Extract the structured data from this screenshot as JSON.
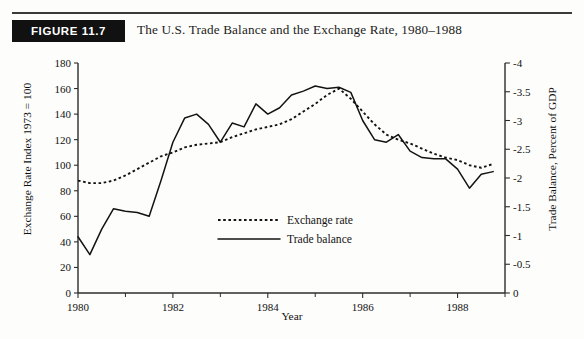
{
  "header": {
    "badge_label": "FIGURE 11.7",
    "title": "The U.S. Trade Balance and the Exchange Rate, 1980–1988"
  },
  "chart_data": {
    "type": "line",
    "title": "The U.S. Trade Balance and the Exchange Rate, 1980–1988",
    "xlabel": "Year",
    "ylabel": "Exchange Rate Index 1973 = 100",
    "ylabel_right": "Trade Balance,  Percent of GDP",
    "xlim": [
      1980,
      1989
    ],
    "ylim": [
      0,
      180
    ],
    "ylim_right": [
      0,
      -4
    ],
    "grid": false,
    "legend_position": "center",
    "xticks": [
      1980,
      1982,
      1984,
      1986,
      1988
    ],
    "xticklabels": [
      "1980",
      "1982",
      "1984",
      "1986",
      "1988"
    ],
    "xticks_minor": [
      1981,
      1983,
      1985,
      1987,
      1989
    ],
    "yticks": [
      0,
      20,
      40,
      60,
      80,
      100,
      120,
      140,
      160,
      180
    ],
    "yticklabels": [
      "0",
      "20",
      "40",
      "60",
      "80",
      "100",
      "120",
      "140",
      "160",
      "180"
    ],
    "yticks_right": [
      0,
      -0.5,
      -1,
      -1.5,
      -2,
      -2.5,
      -3,
      -3.5,
      -4
    ],
    "yticklabels_right": [
      "0",
      "-0.5",
      "-1",
      "-1.5",
      "-2",
      "-2.5",
      "-3",
      "-3.5",
      "-4"
    ],
    "series": [
      {
        "name": "Exchange rate",
        "style": "dotted",
        "axis": "left",
        "x": [
          1980.0,
          1980.25,
          1980.5,
          1980.75,
          1981.0,
          1981.25,
          1981.5,
          1981.75,
          1982.0,
          1982.25,
          1982.5,
          1982.75,
          1983.0,
          1983.25,
          1983.5,
          1983.75,
          1984.0,
          1984.25,
          1984.5,
          1984.75,
          1985.0,
          1985.25,
          1985.5,
          1985.75,
          1986.0,
          1986.25,
          1986.5,
          1986.75,
          1987.0,
          1987.25,
          1987.5,
          1987.75,
          1988.0,
          1988.25,
          1988.5,
          1988.75
        ],
        "y": [
          88,
          86,
          86,
          88,
          92,
          97,
          102,
          107,
          110,
          114,
          116,
          117,
          118,
          122,
          125,
          128,
          130,
          132,
          136,
          142,
          148,
          155,
          160,
          152,
          142,
          132,
          124,
          120,
          117,
          113,
          109,
          106,
          104,
          100,
          98,
          101
        ]
      },
      {
        "name": "Trade balance",
        "style": "solid",
        "axis": "right",
        "x": [
          1980.0,
          1980.25,
          1980.5,
          1980.75,
          1981.0,
          1981.25,
          1981.5,
          1981.75,
          1982.0,
          1982.25,
          1982.5,
          1982.75,
          1983.0,
          1983.25,
          1983.5,
          1983.75,
          1984.0,
          1984.25,
          1984.5,
          1984.75,
          1985.0,
          1985.25,
          1985.5,
          1985.75,
          1986.0,
          1986.25,
          1986.5,
          1986.75,
          1987.0,
          1987.25,
          1987.5,
          1987.75,
          1988.0,
          1988.25,
          1988.5,
          1988.75
        ],
        "y": [
          44,
          30,
          50,
          66,
          64,
          63,
          60,
          88,
          118,
          137,
          140,
          132,
          118,
          133,
          130,
          148,
          140,
          145,
          155,
          158,
          162,
          160,
          161,
          157,
          135,
          120,
          118,
          124,
          111,
          106,
          105,
          105,
          97,
          82,
          93,
          95
        ]
      }
    ],
    "legend": [
      {
        "label": "Exchange rate",
        "style": "dotted"
      },
      {
        "label": "Trade balance",
        "style": "solid"
      }
    ]
  }
}
